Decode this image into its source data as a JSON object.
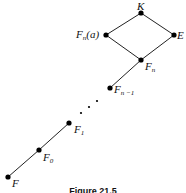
{
  "diagram": {
    "nodes": [
      {
        "id": "K",
        "label": "K",
        "sub": "",
        "suffix": "",
        "x": 141,
        "y": 13,
        "lx": 137,
        "ly": 1
      },
      {
        "id": "E",
        "label": "E",
        "sub": "",
        "suffix": "",
        "x": 174,
        "y": 35,
        "lx": 177,
        "ly": 30
      },
      {
        "id": "Fna",
        "label": "F",
        "sub": "n",
        "suffix": "(a)",
        "x": 106,
        "y": 35,
        "lx": 76,
        "ly": 29
      },
      {
        "id": "Fn",
        "label": "F",
        "sub": "n",
        "suffix": "",
        "x": 141,
        "y": 60,
        "lx": 145,
        "ly": 61
      },
      {
        "id": "Fn1",
        "label": "F",
        "sub": "n −1",
        "suffix": "",
        "x": 110,
        "y": 88,
        "lx": 114,
        "ly": 84
      },
      {
        "id": "F1",
        "label": "F",
        "sub": "1",
        "suffix": "",
        "x": 69,
        "y": 123,
        "lx": 74,
        "ly": 124
      },
      {
        "id": "F0",
        "label": "F",
        "sub": "0",
        "suffix": "",
        "x": 39,
        "y": 150,
        "lx": 43,
        "ly": 152
      },
      {
        "id": "F",
        "label": "F",
        "sub": "",
        "suffix": "",
        "x": 8,
        "y": 177,
        "lx": 12,
        "ly": 178
      }
    ],
    "edges": [
      [
        "K",
        "E"
      ],
      [
        "K",
        "Fna"
      ],
      [
        "Fna",
        "Fn"
      ],
      [
        "E",
        "Fn"
      ],
      [
        "Fn",
        "Fn1"
      ],
      [
        "F1",
        "F0"
      ],
      [
        "F0",
        "F"
      ]
    ],
    "ellipsis_dots": [
      [
        81,
        113
      ],
      [
        89,
        107
      ],
      [
        97,
        101
      ]
    ],
    "caption": "Figure 21.5"
  }
}
